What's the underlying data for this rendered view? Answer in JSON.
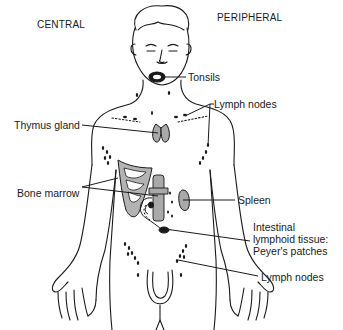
{
  "diagram": {
    "type": "anatomical-illustration",
    "headers": {
      "central": "CENTRAL",
      "peripheral": "PERIPHERAL"
    },
    "labels": {
      "tonsils": "Tonsils",
      "lymph_nodes_upper": "Lymph nodes",
      "thymus": "Thymus gland",
      "bone_marrow": "Bone marrow",
      "spleen": "Spleen",
      "intestinal_line1": "Intestinal",
      "intestinal_line2": "lymphoid tissue:",
      "intestinal_line3": "Peyer's patches",
      "lymph_nodes_lower": "Lymph nodes"
    },
    "colors": {
      "outline": "#1a1a1a",
      "organ_fill": "#a9a9a9",
      "background": "#ffffff"
    }
  }
}
